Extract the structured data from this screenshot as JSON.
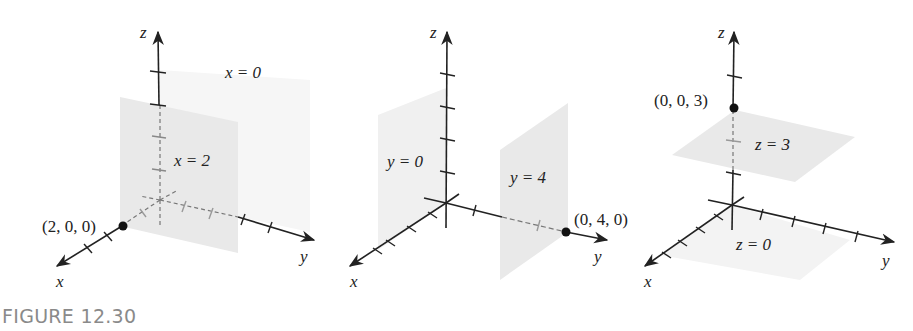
{
  "caption": "FIGURE 12.30",
  "colors": {
    "axis": "#222222",
    "plane": "#e9e9e9",
    "caption": "#8a8a8a",
    "point": "#111111"
  },
  "panels": [
    {
      "axes": {
        "x": "x",
        "y": "y",
        "z": "z"
      },
      "planes": [
        {
          "label": "x = 0"
        },
        {
          "label": "x = 2"
        }
      ],
      "point": {
        "label": "(2, 0, 0)"
      }
    },
    {
      "axes": {
        "x": "x",
        "y": "y",
        "z": "z"
      },
      "planes": [
        {
          "label": "y = 0"
        },
        {
          "label": "y = 4"
        }
      ],
      "point": {
        "label": "(0, 4, 0)"
      }
    },
    {
      "axes": {
        "x": "x",
        "y": "y",
        "z": "z"
      },
      "planes": [
        {
          "label": "z = 3"
        },
        {
          "label": "z = 0"
        }
      ],
      "point": {
        "label": "(0, 0, 3)"
      }
    }
  ]
}
